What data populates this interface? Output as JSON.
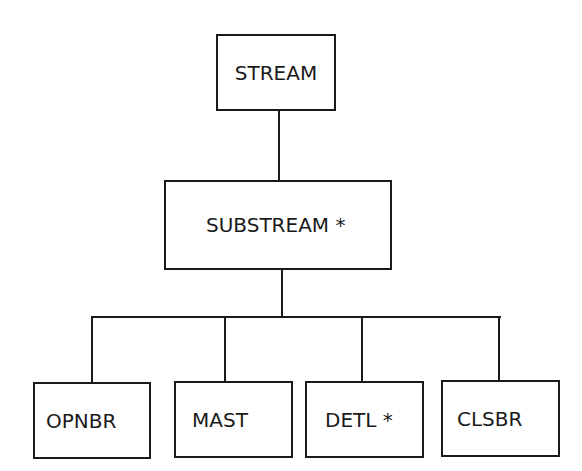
{
  "diagram": {
    "root": {
      "label": "STREAM"
    },
    "level1": {
      "label": "SUBSTREAM *"
    },
    "children": [
      {
        "label": "OPNBR"
      },
      {
        "label": "MAST"
      },
      {
        "label": "DETL *"
      },
      {
        "label": "CLSBR"
      }
    ],
    "colors": {
      "stroke": "#1a1a1a",
      "background": "#ffffff"
    }
  }
}
